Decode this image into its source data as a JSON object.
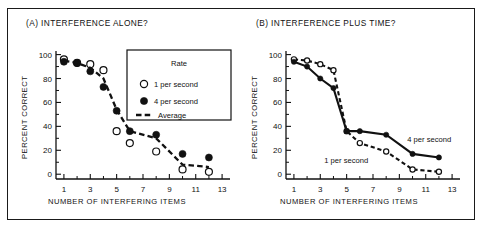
{
  "figure": {
    "panels": [
      {
        "id": "A",
        "title": "(A)  INTERFERENCE ALONE?",
        "xlabel": "NUMBER OF INTERFERING ITEMS",
        "ylabel": "PERCENT CORRECT"
      },
      {
        "id": "B",
        "title": "(B)  INTERFERENCE PLUS TIME?",
        "xlabel": "NUMBER OF INTERFERING ITEMS",
        "ylabel": "PERCENT CORRECT"
      }
    ],
    "legend": {
      "title": "Rate",
      "items": [
        {
          "label": "1 per second",
          "marker": "open-circle"
        },
        {
          "label": "4 per second",
          "marker": "filled-circle"
        },
        {
          "label": "Average",
          "marker": "dashed-line"
        }
      ]
    },
    "inline_labels": {
      "four_per_second": "4 per second",
      "one_per_second": "1 per second"
    },
    "axis": {
      "x_ticks_major": [
        1,
        3,
        5,
        7,
        9,
        11,
        13
      ],
      "x_ticks_minor": [
        2,
        4,
        6,
        8,
        10,
        12
      ],
      "y_ticks_major": [
        0,
        20,
        40,
        60,
        80,
        100
      ],
      "y_ticks_minor": [
        10,
        30,
        50,
        70,
        90
      ],
      "xlim": [
        0.4,
        13.6
      ],
      "ylim": [
        -4,
        103
      ]
    }
  },
  "chart_data": [
    {
      "type": "scatter",
      "panel": "A",
      "title": "(A)  INTERFERENCE ALONE?",
      "xlabel": "NUMBER OF INTERFERING ITEMS",
      "ylabel": "PERCENT CORRECT",
      "xlim": [
        0.4,
        13.6
      ],
      "ylim": [
        -4,
        103
      ],
      "xticks": [
        1,
        3,
        5,
        7,
        9,
        11,
        13
      ],
      "yticks": [
        0,
        20,
        40,
        60,
        80,
        100
      ],
      "grid": false,
      "legend_position": "inside-upper-right",
      "series": [
        {
          "name": "1 per second",
          "marker": "open-circle",
          "x": [
            1,
            2,
            3,
            4,
            5,
            6,
            8,
            10,
            12
          ],
          "values": [
            96,
            93,
            92,
            87,
            36,
            26,
            19,
            4,
            2
          ]
        },
        {
          "name": "4 per second",
          "marker": "filled-circle",
          "x": [
            1,
            2,
            3,
            4,
            5,
            6,
            8,
            10,
            12
          ],
          "values": [
            94,
            93,
            86,
            73,
            53,
            36,
            33,
            17,
            14
          ]
        },
        {
          "name": "Average",
          "marker": "dashed-line",
          "x": [
            1,
            2,
            3,
            4,
            5,
            6,
            8,
            10,
            12
          ],
          "values": [
            95,
            93,
            89,
            80,
            54,
            36,
            30,
            8,
            6
          ]
        }
      ]
    },
    {
      "type": "line",
      "panel": "B",
      "title": "(B)  INTERFERENCE PLUS TIME?",
      "xlabel": "NUMBER OF INTERFERING ITEMS",
      "ylabel": "PERCENT CORRECT",
      "xlim": [
        0.4,
        13.6
      ],
      "ylim": [
        -4,
        103
      ],
      "xticks": [
        1,
        3,
        5,
        7,
        9,
        11,
        13
      ],
      "yticks": [
        0,
        20,
        40,
        60,
        80,
        100
      ],
      "grid": false,
      "legend_position": "inline-annotations",
      "series": [
        {
          "name": "1 per second",
          "marker": "open-circle",
          "linestyle": "dashed",
          "x": [
            1,
            2,
            3,
            4,
            5,
            6,
            8,
            10,
            12
          ],
          "values": [
            96,
            95,
            92,
            87,
            36,
            26,
            19,
            4,
            2
          ]
        },
        {
          "name": "4 per second",
          "marker": "filled-circle",
          "linestyle": "solid",
          "x": [
            1,
            2,
            3,
            4,
            5,
            6,
            8,
            10,
            12
          ],
          "values": [
            94,
            90,
            80,
            72,
            36,
            36,
            33,
            17,
            14
          ]
        }
      ]
    }
  ]
}
